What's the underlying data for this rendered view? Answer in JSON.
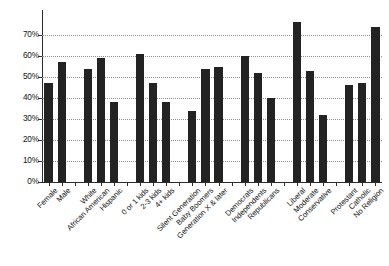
{
  "chart_data": {
    "type": "bar",
    "title": "",
    "subtitle": "",
    "xlabel": "",
    "ylabel": "",
    "ylim": [
      0,
      80
    ],
    "grid": true,
    "legend": false,
    "orientation": "vertical",
    "bar_color": "#232323",
    "value_suffix": "%",
    "ytick_labels": [
      "0%",
      "10%",
      "20%",
      "30%",
      "40%",
      "50%",
      "60%",
      "70%"
    ],
    "ytick_values": [
      0,
      10,
      20,
      30,
      40,
      50,
      60,
      70
    ],
    "categories": [
      "Female",
      "Male",
      "White",
      "African American",
      "Hispanic",
      "0 or 1 kids",
      "2-3 kids",
      "4+ kids",
      "Silent Generation",
      "Baby Boomers",
      "Generation X & later",
      "Democrats",
      "Independents",
      "Republicans",
      "Liberal",
      "Moderate",
      "Conservative",
      "Protestant",
      "Catholic",
      "No Religion"
    ],
    "values": [
      47,
      57,
      54,
      59,
      38,
      61,
      47,
      38,
      34,
      54,
      55,
      60,
      52,
      40,
      76,
      53,
      32,
      46,
      47,
      74
    ],
    "groups": [
      {
        "name": "Gender",
        "categories": [
          "Female",
          "Male"
        ]
      },
      {
        "name": "Race",
        "categories": [
          "White",
          "African American",
          "Hispanic"
        ]
      },
      {
        "name": "Children",
        "categories": [
          "0 or 1 kids",
          "2-3 kids",
          "4+ kids"
        ]
      },
      {
        "name": "Generation",
        "categories": [
          "Silent Generation",
          "Baby Boomers",
          "Generation X & later"
        ]
      },
      {
        "name": "Party",
        "categories": [
          "Democrats",
          "Independents",
          "Republicans"
        ]
      },
      {
        "name": "Ideology",
        "categories": [
          "Liberal",
          "Moderate",
          "Conservative"
        ]
      },
      {
        "name": "Religion",
        "categories": [
          "Protestant",
          "Catholic",
          "No Religion"
        ]
      }
    ]
  }
}
